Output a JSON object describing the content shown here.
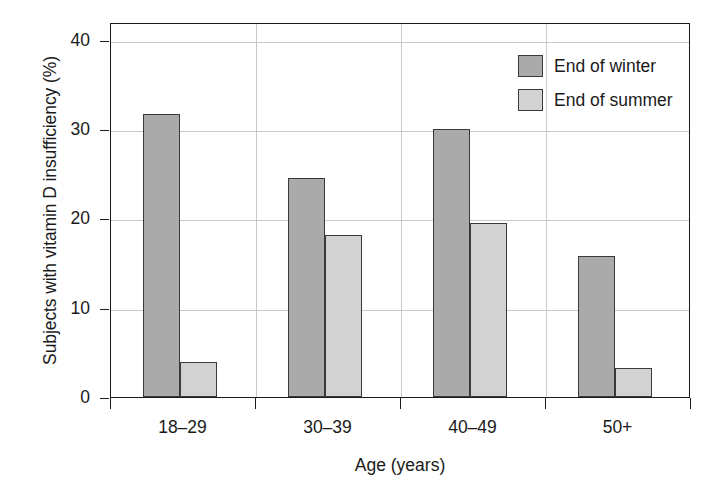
{
  "chart_data": {
    "type": "bar",
    "title": "",
    "xlabel": "Age (years)",
    "ylabel": "Subjects with vitamin D insufficiency (%)",
    "categories": [
      "18–29",
      "30–39",
      "40–49",
      "50+"
    ],
    "yticks": [
      "0",
      "10",
      "20",
      "30",
      "40"
    ],
    "ytick_values": [
      0,
      10,
      20,
      30,
      40
    ],
    "ylim": [
      0,
      42
    ],
    "grid": "both",
    "legend_position": "top-right",
    "series": [
      {
        "name": "End of winter",
        "color": "#aaaaaa",
        "values": [
          31.7,
          24.5,
          30.0,
          15.8
        ]
      },
      {
        "name": "End of summer",
        "color": "#d2d2d2",
        "values": [
          3.9,
          18.2,
          19.5,
          3.2
        ]
      }
    ]
  },
  "legend": {
    "items": [
      {
        "label": "End of winter",
        "swatch": "winter"
      },
      {
        "label": "End of summer",
        "swatch": "summer"
      }
    ]
  },
  "axis": {
    "y_title": "Subjects with vitamin D insufficiency (%)",
    "x_title": "Age (years)"
  }
}
